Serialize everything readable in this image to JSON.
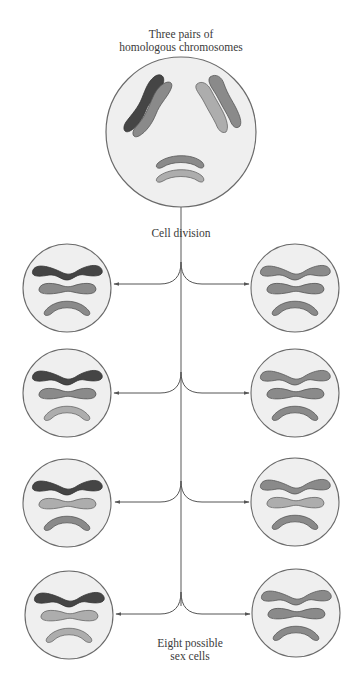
{
  "labels": {
    "title_line1": "Three pairs of",
    "title_line2": "homologous chromosomes",
    "division": "Cell division",
    "result_line1": "Eight possible",
    "result_line2": "sex cells"
  },
  "colors": {
    "background": "#ffffff",
    "cell_fill": "#efefef",
    "cell_outline": "#6a6a6a",
    "chromosome_dark": "#454545",
    "chromosome_medium": "#8a8a8a",
    "chromosome_light": "#adadad",
    "line": "#555555"
  },
  "parent_cell": {
    "center": [
      181,
      132
    ],
    "radius": 75,
    "pairs": [
      {
        "name": "pair-1",
        "chromosomes": [
          "dark",
          "medium"
        ],
        "orientation": "diagonal-left"
      },
      {
        "name": "pair-2",
        "chromosomes": [
          "medium",
          "light"
        ],
        "orientation": "diagonal-right"
      },
      {
        "name": "pair-3",
        "chromosomes": [
          "medium",
          "light"
        ],
        "orientation": "arched-bottom"
      }
    ]
  },
  "daughter_cells": [
    {
      "side": "left",
      "row": 1,
      "center": [
        67,
        288
      ],
      "chromosomes": [
        "dark",
        "medium",
        "medium"
      ]
    },
    {
      "side": "right",
      "row": 1,
      "center": [
        295,
        288
      ],
      "chromosomes": [
        "medium",
        "medium",
        "medium"
      ]
    },
    {
      "side": "left",
      "row": 2,
      "center": [
        67,
        393
      ],
      "chromosomes": [
        "dark",
        "medium",
        "light"
      ]
    },
    {
      "side": "right",
      "row": 2,
      "center": [
        295,
        393
      ],
      "chromosomes": [
        "medium",
        "medium",
        "medium"
      ]
    },
    {
      "side": "left",
      "row": 3,
      "center": [
        67,
        503
      ],
      "chromosomes": [
        "dark",
        "light",
        "medium"
      ]
    },
    {
      "side": "right",
      "row": 3,
      "center": [
        295,
        502
      ],
      "chromosomes": [
        "medium",
        "light",
        "medium"
      ]
    },
    {
      "side": "left",
      "row": 4,
      "center": [
        69,
        615
      ],
      "chromosomes": [
        "dark",
        "light",
        "light"
      ]
    },
    {
      "side": "right",
      "row": 4,
      "center": [
        296,
        613
      ],
      "chromosomes": [
        "medium",
        "medium",
        "medium"
      ]
    }
  ],
  "daughter_radius": 44,
  "branch_rows_y": [
    284,
    393,
    502,
    614
  ],
  "trunk_x": 181
}
